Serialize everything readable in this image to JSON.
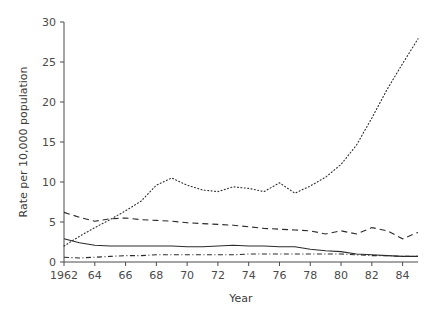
{
  "chart_data": {
    "type": "line",
    "title": "",
    "xlabel": "Year",
    "ylabel": "Rate per 10,000 population",
    "xlim": [
      1962,
      1985
    ],
    "ylim": [
      0,
      30
    ],
    "grid": false,
    "legend": "none",
    "xticks": [
      1962,
      1964,
      1966,
      1968,
      1970,
      1972,
      1974,
      1976,
      1978,
      1980,
      1982,
      1984
    ],
    "xtick_labels": [
      "1962",
      "64",
      "66",
      "68",
      "70",
      "72",
      "74",
      "76",
      "78",
      "80",
      "82",
      "84"
    ],
    "yticks": [
      0,
      5,
      10,
      15,
      20,
      25,
      30
    ],
    "ytick_labels": [
      "0",
      "5",
      "10",
      "15",
      "20",
      "25",
      "30"
    ],
    "x": [
      1962,
      1963,
      1964,
      1965,
      1966,
      1967,
      1968,
      1969,
      1970,
      1971,
      1972,
      1973,
      1974,
      1975,
      1976,
      1977,
      1978,
      1979,
      1980,
      1981,
      1982,
      1983,
      1984,
      1985
    ],
    "series": [
      {
        "name": "series-dotted",
        "style": "dotted",
        "values": [
          2.0,
          3.2,
          4.3,
          5.3,
          6.4,
          7.6,
          9.6,
          10.5,
          9.6,
          9.0,
          8.8,
          9.4,
          9.2,
          8.8,
          9.9,
          8.6,
          9.5,
          10.6,
          12.2,
          14.6,
          18.0,
          21.6,
          24.8,
          27.9
        ]
      },
      {
        "name": "series-dashed",
        "style": "dashed",
        "values": [
          6.2,
          5.6,
          5.1,
          5.4,
          5.5,
          5.3,
          5.2,
          5.1,
          4.9,
          4.8,
          4.7,
          4.6,
          4.4,
          4.2,
          4.1,
          4.0,
          3.9,
          3.5,
          3.9,
          3.5,
          4.3,
          3.9,
          2.9,
          3.7
        ]
      },
      {
        "name": "series-solid",
        "style": "solid",
        "values": [
          2.9,
          2.4,
          2.1,
          2.0,
          2.0,
          2.0,
          2.0,
          2.0,
          1.9,
          1.9,
          2.0,
          2.1,
          2.0,
          2.0,
          1.9,
          1.9,
          1.6,
          1.4,
          1.3,
          1.0,
          0.9,
          0.8,
          0.7,
          0.7
        ]
      },
      {
        "name": "series-dashdot",
        "style": "dashdot",
        "values": [
          0.6,
          0.5,
          0.6,
          0.7,
          0.8,
          0.8,
          0.9,
          0.9,
          0.9,
          0.9,
          0.9,
          0.9,
          1.0,
          1.0,
          1.0,
          1.0,
          1.0,
          1.0,
          1.0,
          0.9,
          0.8,
          0.8,
          0.7,
          0.7
        ]
      }
    ]
  }
}
